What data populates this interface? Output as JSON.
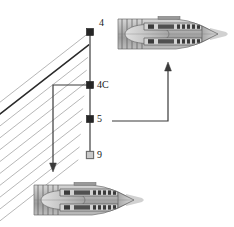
{
  "figure": {
    "type": "engine-station-diagram",
    "background_color": "#ffffff",
    "width": 234,
    "height": 227
  },
  "stations": [
    {
      "id": "4",
      "label": "4",
      "marker": "filled-square",
      "marker_color": "#262626",
      "x": 90,
      "y": 32,
      "label_x": 99,
      "label_y": 18
    },
    {
      "id": "4C",
      "label": "4C",
      "marker": "filled-square",
      "marker_color": "#262626",
      "x": 90,
      "y": 85,
      "label_x": 97,
      "label_y": 80
    },
    {
      "id": "5",
      "label": "5",
      "marker": "filled-square",
      "marker_color": "#262626",
      "x": 90,
      "y": 119,
      "label_x": 97,
      "label_y": 114
    },
    {
      "id": "9",
      "label": "9",
      "marker": "open-square",
      "marker_color": "#c9c9c9",
      "x": 90,
      "y": 155,
      "label_x": 97,
      "label_y": 150
    }
  ],
  "station_axis": {
    "name": "station-line",
    "x": 90,
    "y_top": 32,
    "y_bottom": 155,
    "color": "#6e6e6e"
  },
  "fan_lines": {
    "name": "streamline-fan",
    "count": 11,
    "color": "#8a8a8a",
    "highlight_color": "#1f1f1f",
    "highlight_index": 1,
    "slope": -0.78
  },
  "arrows": [
    {
      "name": "downstream-arrow",
      "direction": "down",
      "color": "#3a3a3a",
      "path": "M 90 85 L 53 85 L 53 164",
      "head_x": 53,
      "head_y": 172
    },
    {
      "name": "upstream-arrow",
      "direction": "up",
      "color": "#3a3a3a",
      "path": "M 112 121 L 168 121 L 168 70",
      "head_x": 168,
      "head_y": 62
    }
  ],
  "engines": [
    {
      "name": "engine-top",
      "position": "top-right",
      "x": 114,
      "y": 10,
      "width": 116,
      "height": 48,
      "orientation": "flow-right",
      "body_color": "#b9b9b9",
      "shade_color": "#8f8f8f",
      "detail_color": "#404040"
    },
    {
      "name": "engine-bottom",
      "position": "bottom-left",
      "x": 30,
      "y": 176,
      "width": 116,
      "height": 48,
      "orientation": "flow-right",
      "body_color": "#b9b9b9",
      "shade_color": "#8f8f8f",
      "detail_color": "#404040"
    }
  ]
}
